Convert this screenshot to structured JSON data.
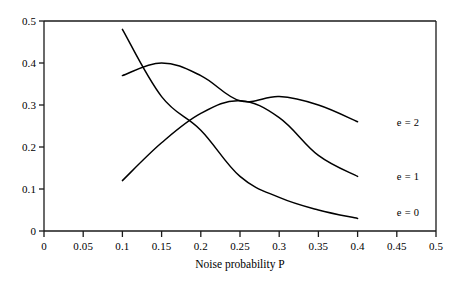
{
  "chart_data": {
    "type": "line",
    "title": "",
    "subtitle": "",
    "xlabel": "Noise probability P",
    "ylabel": "",
    "xlim": [
      0,
      0.5
    ],
    "ylim": [
      0,
      0.5
    ],
    "grid": false,
    "legend_position": "right-inline",
    "x_ticks": [
      0,
      0.05,
      0.1,
      0.15,
      0.2,
      0.25,
      0.3,
      0.35,
      0.4,
      0.45,
      0.5
    ],
    "x_tick_labels": [
      "0",
      "0.05",
      "0.1",
      "0.15",
      "0.2",
      "0.25",
      "0.3",
      "0.35",
      "0.4",
      "0.45",
      "0.5"
    ],
    "y_ticks": [
      0,
      0.1,
      0.2,
      0.3,
      0.4,
      0.5
    ],
    "y_tick_labels": [
      "0",
      "0.1",
      "0.2",
      "0.3",
      "0.4",
      "0.5"
    ],
    "x": [
      0.1,
      0.15,
      0.2,
      0.25,
      0.3,
      0.35,
      0.4
    ],
    "series": [
      {
        "name": "e = 2",
        "label": "e = 2",
        "color": "#000000",
        "values": [
          0.37,
          0.4,
          0.37,
          0.31,
          0.32,
          0.3,
          0.26
        ],
        "label_at": {
          "x": 0.45,
          "y": 0.26
        }
      },
      {
        "name": "e = 1",
        "label": "e = 1",
        "color": "#000000",
        "values": [
          0.12,
          0.21,
          0.28,
          0.31,
          0.27,
          0.18,
          0.13
        ],
        "label_at": {
          "x": 0.45,
          "y": 0.13
        }
      },
      {
        "name": "e = 0",
        "label": "e = 0",
        "color": "#000000",
        "values": [
          0.48,
          0.32,
          0.24,
          0.13,
          0.08,
          0.05,
          0.03
        ],
        "label_at": {
          "x": 0.45,
          "y": 0.045
        }
      }
    ],
    "axis_color": "#1a1a1a",
    "line_color": "#000000"
  }
}
